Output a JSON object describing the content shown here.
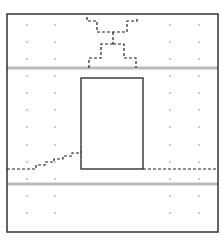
{
  "diagram": {
    "canvas": {
      "width": 222,
      "height": 244,
      "background": "#ffffff"
    },
    "frame": {
      "x": 7,
      "y": 14,
      "width": 211,
      "height": 218,
      "stroke": "#333333",
      "stroke_width": 1.5
    },
    "gray_lines": [
      {
        "y": 68,
        "x1": 7,
        "x2": 218,
        "stroke": "#bbbbbb",
        "stroke_width": 3
      },
      {
        "y": 184,
        "x1": 7,
        "x2": 218,
        "stroke": "#bbbbbb",
        "stroke_width": 3
      }
    ],
    "dot_grid": {
      "columns": [
        27,
        55,
        170,
        199
      ],
      "rows": [
        25,
        42,
        59,
        76,
        93,
        110,
        127,
        145,
        162,
        179,
        196,
        213
      ],
      "color": "#bbbbbb",
      "radius": 1
    },
    "rectangle": {
      "x": 81,
      "y": 78,
      "width": 62,
      "height": 91,
      "stroke": "#222222",
      "stroke_width": 1.3
    },
    "dashed_paths": [
      {
        "name": "top-left-upper",
        "points": [
          [
            87,
            17
          ],
          [
            87,
            21
          ],
          [
            97,
            21
          ],
          [
            97,
            32
          ],
          [
            127,
            32
          ],
          [
            127,
            21
          ],
          [
            137,
            21
          ],
          [
            137,
            17
          ]
        ]
      },
      {
        "name": "top-center-stem",
        "points": [
          [
            113,
            32
          ],
          [
            113,
            44
          ]
        ]
      },
      {
        "name": "top-lower-left",
        "points": [
          [
            113,
            44
          ],
          [
            101,
            44
          ],
          [
            101,
            58
          ],
          [
            89,
            58
          ],
          [
            89,
            68
          ]
        ]
      },
      {
        "name": "top-lower-right",
        "points": [
          [
            113,
            44
          ],
          [
            124,
            44
          ],
          [
            124,
            58
          ],
          [
            136,
            58
          ],
          [
            136,
            68
          ]
        ]
      },
      {
        "name": "bottom-left-staircase",
        "points": [
          [
            7,
            169
          ],
          [
            36,
            169
          ],
          [
            36,
            165
          ],
          [
            45,
            165
          ],
          [
            45,
            162
          ],
          [
            54,
            162
          ],
          [
            54,
            159
          ],
          [
            63,
            159
          ],
          [
            63,
            156
          ],
          [
            72,
            156
          ],
          [
            72,
            153
          ],
          [
            79,
            153
          ],
          [
            79,
            152
          ],
          [
            81,
            152
          ]
        ]
      },
      {
        "name": "bottom-right",
        "points": [
          [
            143,
            169
          ],
          [
            218,
            169
          ]
        ]
      }
    ],
    "dash_style": {
      "stroke": "#222222",
      "stroke_width": 1.2,
      "dasharray": "3,2"
    }
  }
}
